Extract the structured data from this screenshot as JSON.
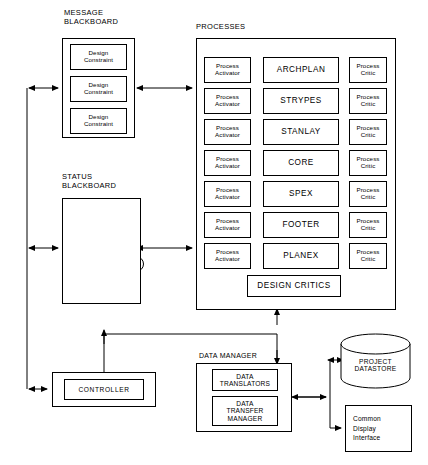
{
  "diagram": {
    "sections": {
      "message_blackboard": {
        "caption": "MESSAGE\nBLACKBOARD",
        "items": [
          {
            "label": "Design\nConstraint"
          },
          {
            "label": "Design\nConstraint"
          },
          {
            "label": "Design\nConstraint"
          }
        ]
      },
      "status_blackboard": {
        "caption": "STATUS\nBLACKBOARD",
        "graph": {
          "type": "tree",
          "nodes": [
            "root",
            "n1",
            "n2",
            "n3",
            "n4",
            "n5",
            "n6"
          ],
          "edges": [
            [
              "root",
              "n1"
            ],
            [
              "root",
              "n2"
            ],
            [
              "n1",
              "n3"
            ],
            [
              "n1",
              "n4"
            ],
            [
              "n2",
              "n5"
            ],
            [
              "n3",
              "n6"
            ]
          ]
        }
      },
      "processes": {
        "caption": "PROCESSES",
        "activator_label": "Process\nActivator",
        "critic_label": "Process\nCritic",
        "rows": [
          {
            "name": "ARCHPLAN"
          },
          {
            "name": "STRYPES"
          },
          {
            "name": "STANLAY"
          },
          {
            "name": "CORE"
          },
          {
            "name": "SPEX"
          },
          {
            "name": "FOOTER"
          },
          {
            "name": "PLANEX"
          }
        ],
        "design_critics": "DESIGN CRITICS"
      },
      "controller": {
        "label": "CONTROLLER"
      },
      "data_manager": {
        "caption": "DATA MANAGER",
        "items": [
          {
            "label": "DATA\nTRANSLATORS"
          },
          {
            "label": "DATA\nTRANSFER\nMANAGER"
          }
        ]
      },
      "project_datastore": {
        "label": "PROJECT\nDATASTORE"
      },
      "common_display": {
        "label": "Common\nDisplay\nInterface"
      }
    }
  }
}
